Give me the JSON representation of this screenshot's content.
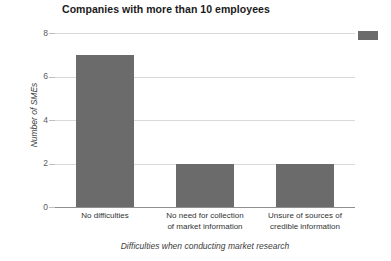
{
  "chart_data": {
    "type": "bar",
    "title": "Companies with more than 10 employees",
    "xlabel": "Difficulties when conducting market research",
    "ylabel": "Number of SMEs",
    "categories": [
      "No difficulties",
      "No need for collection of market information",
      "Unsure of sources of credible information"
    ],
    "category_lines": [
      [
        "No difficulties"
      ],
      [
        "No need for collection",
        "of market information"
      ],
      [
        "Unsure of sources of",
        "credible information"
      ]
    ],
    "values": [
      7,
      2,
      2
    ],
    "ylim": [
      0,
      8
    ],
    "yticks": [
      0,
      2,
      4,
      6,
      8
    ],
    "ytick_labels": [
      "0",
      "2",
      "4",
      "6",
      "8"
    ],
    "grid": true,
    "grid_axis": "y",
    "legend": {
      "position": "top-right",
      "entries": [
        {
          "label": "",
          "color": "#6b6b6b"
        }
      ]
    },
    "bar_color": "#6b6b6b",
    "background_color": "#ffffff",
    "gridline_color": "#d9d9d9",
    "axis_line_color": "#8f8f8f"
  }
}
